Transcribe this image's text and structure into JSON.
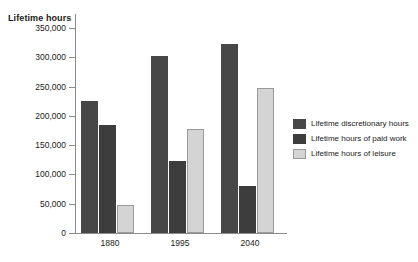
{
  "chart_data": {
    "type": "bar",
    "title": "",
    "xlabel": "",
    "ylabel": "Lifetime hours",
    "categories": [
      "1880",
      "1995",
      "2040"
    ],
    "series": [
      {
        "name": "Lifetime discretionary hours",
        "color": "#474747",
        "values": [
          225000,
          302000,
          322000
        ]
      },
      {
        "name": "Lifetime hours of paid work",
        "color": "#3d3d3d",
        "values": [
          185000,
          123000,
          80000
        ]
      },
      {
        "name": "Lifetime hours of leisure",
        "color": "#d4d4d4",
        "values": [
          47000,
          178000,
          248000
        ]
      }
    ],
    "ylim": [
      0,
      350000
    ],
    "ytick_values": [
      0,
      50000,
      100000,
      150000,
      200000,
      250000,
      300000,
      350000
    ],
    "ytick_labels": [
      "0",
      "50,000",
      "100,000",
      "150,000",
      "200,000",
      "250,000",
      "300,000",
      "350,000"
    ],
    "grid": false,
    "legend_position": "right"
  },
  "legend": {
    "items": [
      {
        "label": "Lifetime discretionary hours"
      },
      {
        "label": "Lifetime hours of paid work"
      },
      {
        "label": "Lifetime hours of leisure"
      }
    ]
  }
}
